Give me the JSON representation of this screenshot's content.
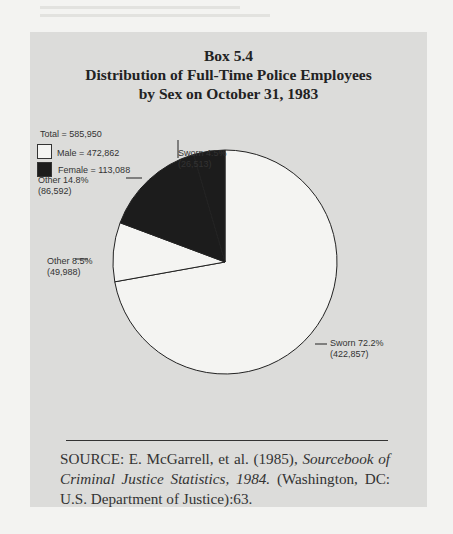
{
  "box": {
    "label": "Box 5.4",
    "title_line1": "Distribution of Full-Time Police Employees",
    "title_line2": "by Sex on October 31, 1983"
  },
  "legend": {
    "total": "Total = 585,950",
    "male": "Male = 472,862",
    "female": "Female = 113,088"
  },
  "slice_labels": {
    "sworn_male": {
      "line1": "Sworn 72.2%",
      "line2": "(422,857)"
    },
    "other_male": {
      "line1": "Other 8.5%",
      "line2": "(49,988)"
    },
    "other_female": {
      "line1": "Other 14.8%",
      "line2": "(86,592)"
    },
    "sworn_female": {
      "line1": "Sworn 4.5%",
      "line2": "(26,513)"
    }
  },
  "source": {
    "prefix": "SOURCE:  E. McGarrell, et al. (1985), ",
    "italic": "Sourcebook of Criminal Justice Statistics, 1984.",
    "suffix": " (Washington, DC: U.S. Department of Justice):63."
  },
  "colors": {
    "male": "#f4f4f2",
    "female": "#1c1c1c",
    "background": "#dcdcda"
  },
  "chart_data": {
    "type": "pie",
    "title": "Box 5.4 Distribution of Full-Time Police Employees by Sex on October 31, 1983",
    "total": 585950,
    "groups": [
      {
        "name": "Male",
        "value": 472862,
        "color": "white"
      },
      {
        "name": "Female",
        "value": 113088,
        "color": "black"
      }
    ],
    "categories": [
      "Sworn (Male)",
      "Other (Male)",
      "Other (Female)",
      "Sworn (Female)"
    ],
    "values": [
      422857,
      49988,
      86592,
      26513
    ],
    "percentages": [
      72.2,
      8.5,
      14.8,
      4.5
    ],
    "start_angle": "12 o'clock, clockwise",
    "legend_position": "upper-left"
  }
}
